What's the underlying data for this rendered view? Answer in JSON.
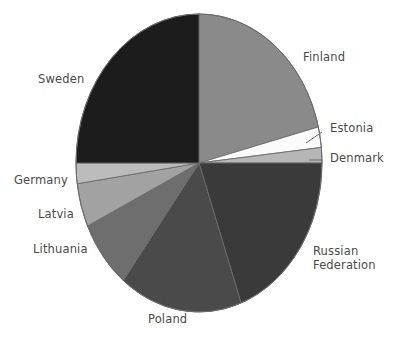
{
  "figure": {
    "background_color": "#ffffff",
    "label_color": "#4a4a4a",
    "outline_color": "#6b6b6b"
  },
  "chart_data": {
    "type": "pie",
    "title": "",
    "subtitle": "",
    "xlabel": "",
    "ylabel": "",
    "legend_position": "none",
    "labels_position": "outside-callout",
    "grid": false,
    "start_angle_deg": 0,
    "direction": "clockwise",
    "categories": [
      "Finland",
      "Estonia",
      "Denmark",
      "Russian Federation",
      "Poland",
      "Lithuania",
      "Latvia",
      "Germany",
      "Sweden"
    ],
    "values": [
      21.1,
      2.2,
      1.7,
      19.4,
      16.1,
      7.5,
      4.7,
      2.2,
      25.0
    ],
    "slices": [
      {
        "label": "Finland",
        "value": 21.1,
        "start_deg": 0.0,
        "end_deg": 76.0,
        "color": "#8a8a8a",
        "callout": false
      },
      {
        "label": "Estonia",
        "value": 2.2,
        "start_deg": 76.0,
        "end_deg": 84.0,
        "color": "#fbfbfb",
        "callout": true
      },
      {
        "label": "Denmark",
        "value": 1.7,
        "start_deg": 84.0,
        "end_deg": 90.0,
        "color": "#b6b6b6",
        "callout": true
      },
      {
        "label": "Russian Federation",
        "value": 19.4,
        "start_deg": 90.0,
        "end_deg": 160.0,
        "color": "#3a3a3a",
        "callout": false
      },
      {
        "label": "Poland",
        "value": 16.1,
        "start_deg": 160.0,
        "end_deg": 218.0,
        "color": "#4a4a4a",
        "callout": false
      },
      {
        "label": "Lithuania",
        "value": 7.5,
        "start_deg": 218.0,
        "end_deg": 245.0,
        "color": "#6e6e6e",
        "callout": false
      },
      {
        "label": "Latvia",
        "value": 4.7,
        "start_deg": 245.0,
        "end_deg": 262.0,
        "color": "#a2a2a2",
        "callout": false
      },
      {
        "label": "Germany",
        "value": 2.2,
        "start_deg": 262.0,
        "end_deg": 270.0,
        "color": "#bcbcbc",
        "callout": false
      },
      {
        "label": "Sweden",
        "value": 25.0,
        "start_deg": 270.0,
        "end_deg": 360.0,
        "color": "#1c1c1c",
        "callout": false
      }
    ]
  },
  "labels": {
    "sweden": "Sweden",
    "finland": "Finland",
    "estonia": "Estonia",
    "denmark": "Denmark",
    "russian_federation_line1": "Russian",
    "russian_federation_line2": "Federation",
    "poland": "Poland",
    "lithuania": "Lithuania",
    "latvia": "Latvia",
    "germany": "Germany"
  }
}
